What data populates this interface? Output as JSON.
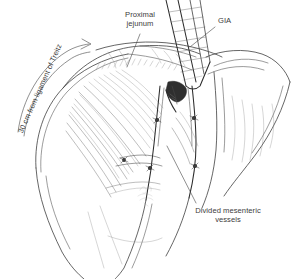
{
  "figure": {
    "domain": "medical-surgical-illustration",
    "background_color": "#ffffff",
    "ink_color": "#3c3c3c",
    "width": 293,
    "height": 279
  },
  "labels": {
    "proximal_jejunum": "Proximal\njejunum",
    "gia": "GIA",
    "divided_vessels": "Divided mesenteric\nvessels",
    "treitz": "30 cm from ligament of Treitz"
  },
  "annotations": {
    "leader_lines": [
      {
        "name": "proximal-jejunum-leader",
        "from": [
          140,
          34
        ],
        "to": [
          128,
          66
        ]
      },
      {
        "name": "gia-leader",
        "from": [
          216,
          26
        ],
        "to": [
          190,
          46
        ]
      },
      {
        "name": "divided-vessels-leader",
        "from": [
          196,
          204
        ],
        "to": [
          168,
          148
        ]
      }
    ],
    "measurement_arrow": {
      "name": "treitz-arc-arrow",
      "label": "30 cm from ligament of Treitz",
      "arrowhead": [
        90,
        44
      ]
    }
  },
  "structures": [
    {
      "name": "proximal-jejunum-loop",
      "kind": "bowel"
    },
    {
      "name": "distal-jejunum-loop",
      "kind": "bowel"
    },
    {
      "name": "mesentery-fan",
      "kind": "mesentery"
    },
    {
      "name": "gia-stapler",
      "kind": "instrument"
    },
    {
      "name": "divided-bowel-end",
      "kind": "transection"
    },
    {
      "name": "ligated-vessel-stumps",
      "kind": "vessels"
    },
    {
      "name": "artist-signature",
      "kind": "signature"
    }
  ]
}
